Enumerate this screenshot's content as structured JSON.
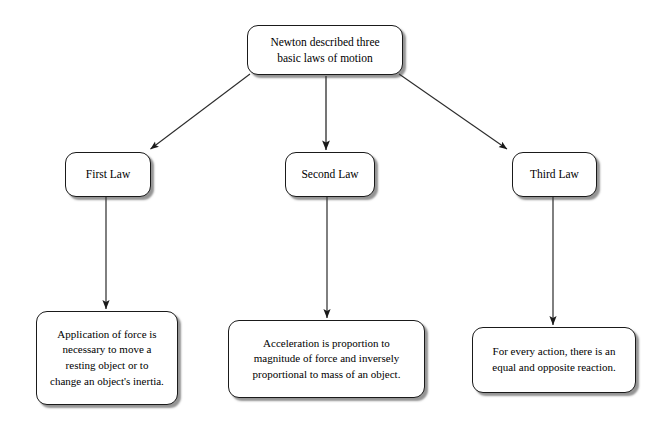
{
  "diagram": {
    "background_color": "#ffffff",
    "node_fill_color": "#ffffff",
    "node_border_color": "#1a1a1a",
    "text_color": "#000000",
    "connector_color": "#333333",
    "root": {
      "label": "Newton described three\nbasic laws of motion"
    },
    "laws": [
      {
        "label": "First Law"
      },
      {
        "label": "Second Law"
      },
      {
        "label": "Third Law"
      }
    ],
    "descriptions": [
      {
        "label": "Application of force is\nnecessary to move a\nresting object or to\nchange an object's inertia."
      },
      {
        "label": "Acceleration is proportion to\nmagnitude of force and inversely\nproportional to mass of an object."
      },
      {
        "label": "For every action, there is an\nequal and opposite reaction."
      }
    ],
    "connectors": [
      {
        "name": "root-to-first-law",
        "from": "root",
        "to": "First Law",
        "style": "diagonal-arrow"
      },
      {
        "name": "root-to-second-law",
        "from": "root",
        "to": "Second Law",
        "style": "vertical-arrow"
      },
      {
        "name": "root-to-third-law",
        "from": "root",
        "to": "Third Law",
        "style": "diagonal-arrow"
      },
      {
        "name": "first-law-to-description",
        "from": "First Law",
        "to": "description-1",
        "style": "vertical-arrow"
      },
      {
        "name": "second-law-to-description",
        "from": "Second Law",
        "to": "description-2",
        "style": "vertical-arrow"
      },
      {
        "name": "third-law-to-description",
        "from": "Third Law",
        "to": "description-3",
        "style": "vertical-arrow"
      }
    ]
  }
}
